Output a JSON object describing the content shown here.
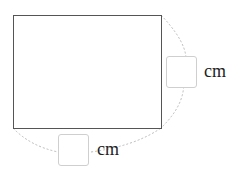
{
  "diagram": {
    "shape": "rectangle",
    "stroke_color": "#555555",
    "arc_color": "#bbbbbb"
  },
  "inputs": {
    "height": {
      "value": "",
      "unit": "cm"
    },
    "width": {
      "value": "",
      "unit": "cm"
    }
  }
}
